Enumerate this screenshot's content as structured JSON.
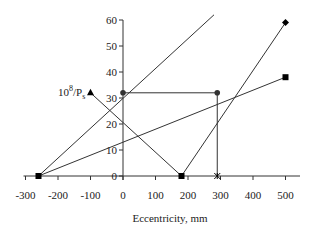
{
  "chart_data": {
    "type": "line",
    "title": "",
    "xlabel": "Eccentricity, mm",
    "ylabel": "",
    "xlim": [
      -300,
      500
    ],
    "ylim": [
      0,
      60
    ],
    "xticks": [
      -300,
      -200,
      -100,
      0,
      100,
      200,
      300,
      400,
      500
    ],
    "yticks": [
      0,
      10,
      20,
      30,
      40,
      50,
      60
    ],
    "grid": false,
    "annotations": [
      {
        "text": "10",
        "sup": "8",
        "rest": "/P",
        "sub": "s",
        "x": -160,
        "y": 31
      }
    ],
    "series": [
      {
        "name": "line-a",
        "marker": "none",
        "color": "#333333",
        "points": [
          [
            -260,
            0
          ],
          [
            280,
            62
          ]
        ]
      },
      {
        "name": "line-b",
        "marker": "square",
        "color": "#333333",
        "points": [
          [
            -260,
            0
          ],
          [
            500,
            38
          ]
        ]
      },
      {
        "name": "line-c",
        "marker": "triangle-square-diamond",
        "color": "#333333",
        "points": [
          [
            -100,
            32
          ],
          [
            180,
            0
          ],
          [
            500,
            59
          ]
        ],
        "markers": [
          "triangle",
          "square",
          "diamond"
        ]
      },
      {
        "name": "line-d",
        "marker": "circle-asterisk",
        "color": "#333333",
        "points": [
          [
            0,
            32
          ],
          [
            290,
            32
          ],
          [
            290,
            0
          ]
        ],
        "markers": [
          "circle",
          "circle",
          "asterisk"
        ]
      }
    ]
  },
  "labels": {
    "xlabel": "Eccentricity, mm",
    "series_label_base": "10",
    "series_label_sup": "8",
    "series_label_mid": "/P",
    "series_label_sub": "s"
  }
}
